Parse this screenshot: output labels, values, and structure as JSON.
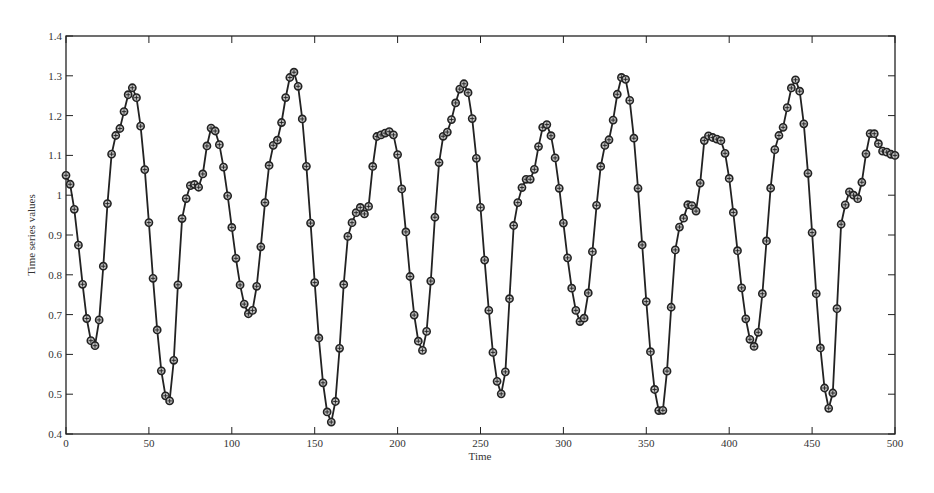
{
  "chart_data": {
    "type": "line",
    "title": "",
    "xlabel": "Time",
    "ylabel": "Time series values",
    "xlim": [
      0,
      500
    ],
    "ylim": [
      0.4,
      1.4
    ],
    "xticks": [
      "0",
      "50",
      "100",
      "150",
      "200",
      "250",
      "300",
      "350",
      "400",
      "450",
      "500"
    ],
    "yticks": [
      "0.4",
      "0.5",
      "0.6",
      "0.7",
      "0.8",
      "0.9",
      "1",
      "1.1",
      "1.2",
      "1.3",
      "1.4"
    ],
    "grid": false,
    "legend": null,
    "marker": "circle-with-plus",
    "line_color": "#222222",
    "sample_step": 2.5,
    "series": [
      {
        "name": "Time series values",
        "keypoints_x": [
          0,
          17,
          30,
          40,
          62,
          72,
          76,
          80,
          88,
          111,
          126,
          137,
          160,
          172,
          177,
          181,
          188,
          196,
          215,
          228,
          240,
          263,
          272,
          277,
          280,
          289,
          311,
          326,
          336,
          359,
          370,
          376,
          380,
          386,
          394,
          415,
          430,
          440,
          461,
          469,
          473,
          477,
          486,
          493,
          500
        ],
        "keypoints_y": [
          1.05,
          0.62,
          1.15,
          1.27,
          0.48,
          0.99,
          1.03,
          1.02,
          1.17,
          0.7,
          1.13,
          1.31,
          0.43,
          0.93,
          0.97,
          0.95,
          1.15,
          1.16,
          0.61,
          1.15,
          1.28,
          0.5,
          0.98,
          1.04,
          1.04,
          1.18,
          0.68,
          1.13,
          1.3,
          0.45,
          0.92,
          0.98,
          0.96,
          1.15,
          1.14,
          0.62,
          1.15,
          1.29,
          0.46,
          0.97,
          1.01,
          0.99,
          1.16,
          1.11,
          1.1
        ]
      }
    ]
  }
}
